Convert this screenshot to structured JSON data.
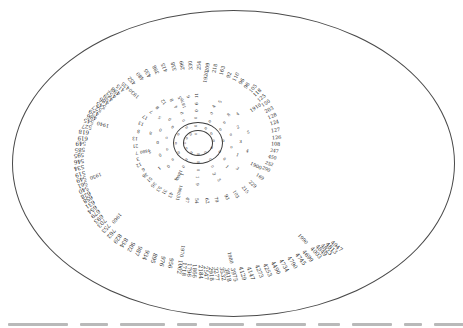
{
  "figure": {
    "border_shape": "ellipse",
    "background_color": "#ffffff",
    "ink_color": "#1f1f1f"
  },
  "chart_data": {
    "type": "line",
    "layout": "spiral",
    "title": "",
    "xlabel": "",
    "ylabel": "",
    "x_start_year": 1800,
    "x_end_year": 1994,
    "decade_labels": [
      "1860",
      "1870",
      "1880",
      "1890",
      "1900",
      "1910",
      "1920",
      "1930",
      "1940",
      "1950",
      "1960",
      "1970",
      "1980",
      "1990"
    ],
    "x": [
      1800,
      1801,
      1802,
      1803,
      1804,
      1805,
      1806,
      1807,
      1808,
      1809,
      1810,
      1811,
      1812,
      1813,
      1814,
      1815,
      1816,
      1817,
      1818,
      1819,
      1820,
      1821,
      1822,
      1823,
      1824,
      1825,
      1826,
      1827,
      1828,
      1829,
      1830,
      1831,
      1832,
      1833,
      1834,
      1835,
      1836,
      1837,
      1838,
      1839,
      1840,
      1841,
      1842,
      1843,
      1844,
      1845,
      1846,
      1847,
      1848,
      1849,
      1850,
      1851,
      1852,
      1853,
      1854,
      1855,
      1856,
      1857,
      1858,
      1859,
      1860,
      1861,
      1862,
      1863,
      1864,
      1865,
      1866,
      1867,
      1868,
      1869,
      1870,
      1871,
      1872,
      1873,
      1874,
      1875,
      1876,
      1877,
      1878,
      1879,
      1880,
      1881,
      1882,
      1883,
      1884,
      1885,
      1886,
      1887,
      1888,
      1889,
      1890,
      1891,
      1892,
      1893,
      1894,
      1895,
      1896,
      1897,
      1898,
      1899,
      1900,
      1901,
      1902,
      1903,
      1904,
      1905,
      1906,
      1907,
      1908,
      1909,
      1910,
      1911,
      1912,
      1913,
      1914,
      1915,
      1916,
      1917,
      1918,
      1919,
      1920,
      1921,
      1922,
      1923,
      1924,
      1925,
      1926,
      1927,
      1928,
      1929,
      1930,
      1931,
      1932,
      1933,
      1934,
      1935,
      1936,
      1937,
      1938,
      1939,
      1940,
      1941,
      1942,
      1943,
      1944,
      1945,
      1946,
      1947,
      1948,
      1949,
      1950,
      1951,
      1952,
      1953,
      1954,
      1955,
      1956,
      1957,
      1958,
      1959,
      1960,
      1961,
      1962,
      1963,
      1964,
      1965,
      1966,
      1967,
      1968,
      1969,
      1970,
      1971,
      1972,
      1973,
      1974,
      1975,
      1976,
      1977,
      1978,
      1979,
      1980,
      1981,
      1982,
      1983,
      1984,
      1985,
      1986,
      1987,
      1988,
      1989,
      1990,
      1991,
      1992,
      1993,
      1994
    ],
    "values": [
      0,
      0,
      0,
      0,
      0,
      0,
      0,
      0,
      0,
      0,
      0,
      0,
      0,
      0,
      0,
      0,
      0,
      0,
      0,
      0,
      0,
      0,
      0,
      0,
      0,
      0,
      0,
      0,
      0,
      0,
      0,
      0,
      0,
      0,
      0,
      0,
      0,
      0,
      0,
      0,
      0,
      0,
      0,
      0,
      0,
      1,
      1,
      3,
      1,
      1,
      3,
      2,
      8,
      4,
      6,
      4,
      5,
      8,
      5,
      1,
      4,
      9,
      5,
      3,
      4,
      5,
      4,
      5,
      11,
      6,
      5,
      8,
      12,
      8,
      7,
      17,
      13,
      8,
      13,
      21,
      7,
      3,
      12,
      6,
      36,
      51,
      36,
      53,
      31,
      43,
      31,
      47,
      54,
      62,
      79,
      93,
      103,
      215,
      229,
      169,
      290,
      252,
      450,
      247,
      108,
      126,
      127,
      124,
      128,
      203,
      150,
      125,
      118,
      105,
      98,
      96,
      110,
      92,
      163,
      218,
      209,
      254,
      330,
      299,
      338,
      415,
      398,
      435,
      480,
      452,
      435,
      415,
      498,
      452,
      429,
      486,
      545,
      527,
      429,
      486,
      545,
      527,
      618,
      619,
      549,
      585,
      595,
      546,
      534,
      519,
      549,
      561,
      540,
      628,
      658,
      631,
      654,
      679,
      693,
      703,
      753,
      762,
      829,
      834,
      902,
      987,
      934,
      895,
      976,
      956,
      1002,
      1718,
      1796,
      1866,
      2184,
      2547,
      2918,
      3277,
      3532,
      3818,
      3975,
      4129,
      4147,
      4273,
      4253,
      4490,
      4734,
      4790,
      4745,
      4699,
      4003,
      4849,
      4823,
      4813,
      4947
    ]
  },
  "caption": {
    "truncated": true,
    "segments": [
      60,
      28,
      45,
      20,
      35,
      50,
      22,
      40,
      18,
      30
    ]
  }
}
